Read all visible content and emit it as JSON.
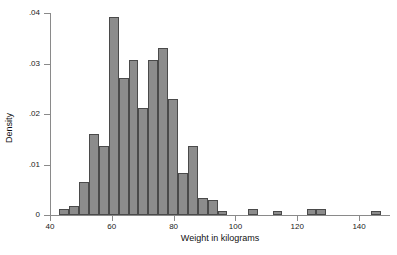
{
  "chart_data": {
    "type": "bar",
    "title": "",
    "subtitle": "",
    "xlabel": "Weight in kilograms",
    "ylabel": "Density",
    "xlim": [
      40,
      150
    ],
    "ylim": [
      0,
      0.04
    ],
    "grid": false,
    "legend": null,
    "bin_width": 3.2,
    "x_ticks": [
      {
        "value": 40,
        "label": "40"
      },
      {
        "value": 60,
        "label": "60"
      },
      {
        "value": 80,
        "label": "80"
      },
      {
        "value": 100,
        "label": "100"
      },
      {
        "value": 120,
        "label": "120"
      },
      {
        "value": 140,
        "label": "140"
      }
    ],
    "y_ticks": [
      {
        "value": 0,
        "label": "0"
      },
      {
        "value": 0.01,
        "label": ".01"
      },
      {
        "value": 0.02,
        "label": ".02"
      },
      {
        "value": 0.03,
        "label": ".03"
      },
      {
        "value": 0.04,
        "label": ".04"
      }
    ],
    "bar_fill_color": "#8c8c8c",
    "bar_edge_color": "#4a4a4a",
    "axis_color": "#8a8a8a",
    "background_color": "#ffffff",
    "bins": [
      {
        "x0": 43.0,
        "x1": 46.2,
        "density": 0.0012
      },
      {
        "x0": 46.2,
        "x1": 49.4,
        "density": 0.0017
      },
      {
        "x0": 49.4,
        "x1": 52.6,
        "density": 0.0065
      },
      {
        "x0": 52.6,
        "x1": 55.8,
        "density": 0.016
      },
      {
        "x0": 55.8,
        "x1": 59.0,
        "density": 0.0136
      },
      {
        "x0": 59.0,
        "x1": 62.2,
        "density": 0.0392
      },
      {
        "x0": 62.2,
        "x1": 65.4,
        "density": 0.0272
      },
      {
        "x0": 65.4,
        "x1": 68.6,
        "density": 0.0306
      },
      {
        "x0": 68.6,
        "x1": 71.8,
        "density": 0.0212
      },
      {
        "x0": 71.8,
        "x1": 75.0,
        "density": 0.0306
      },
      {
        "x0": 75.0,
        "x1": 78.2,
        "density": 0.033
      },
      {
        "x0": 78.2,
        "x1": 81.4,
        "density": 0.023
      },
      {
        "x0": 81.4,
        "x1": 84.6,
        "density": 0.0083
      },
      {
        "x0": 84.6,
        "x1": 87.8,
        "density": 0.0136
      },
      {
        "x0": 87.8,
        "x1": 91.0,
        "density": 0.0034
      },
      {
        "x0": 91.0,
        "x1": 94.2,
        "density": 0.0029
      },
      {
        "x0": 94.2,
        "x1": 97.4,
        "density": 0.0007
      },
      {
        "x0": 104.0,
        "x1": 107.2,
        "density": 0.0012
      },
      {
        "x0": 112.0,
        "x1": 115.2,
        "density": 0.0007
      },
      {
        "x0": 123.0,
        "x1": 126.2,
        "density": 0.0012
      },
      {
        "x0": 126.2,
        "x1": 129.4,
        "density": 0.0012
      },
      {
        "x0": 144.0,
        "x1": 147.2,
        "density": 0.0007
      }
    ]
  }
}
